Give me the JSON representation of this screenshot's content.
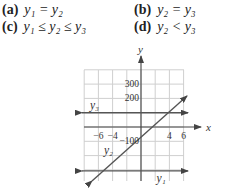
{
  "options": [
    {
      "label": "(a)",
      "expr": "y₁ = y₂"
    },
    {
      "label": "(b)",
      "expr": "y₂ = y₃"
    },
    {
      "label": "(c)",
      "expr": "y₁ ≤ y₂ ≤ y₃"
    },
    {
      "label": "(d)",
      "expr": "y₂ < y₃"
    }
  ],
  "chart_data": {
    "type": "line",
    "title": "",
    "xlabel": "x",
    "ylabel": "y",
    "xlim": [
      -7,
      7
    ],
    "ylim": [
      -400,
      400
    ],
    "grid": true,
    "x_tick_labels": [
      "-6",
      "-4",
      "4",
      "6"
    ],
    "x_ticks": [
      -6,
      -4,
      4,
      6
    ],
    "y_tick_labels": [
      "300",
      "200",
      "-100"
    ],
    "y_ticks": [
      300,
      200,
      -100
    ],
    "series": [
      {
        "name": "y3",
        "label": "y₃",
        "kind": "horizontal",
        "x": [
          -7,
          7
        ],
        "y": [
          100,
          100
        ]
      },
      {
        "name": "y2",
        "label": "y₂",
        "kind": "diagonal",
        "x": [
          -7,
          7
        ],
        "y": [
          -400,
          200
        ]
      },
      {
        "name": "y1",
        "label": "y₁",
        "kind": "horizontal",
        "x": [
          -7,
          7
        ],
        "y": [
          -300,
          -300
        ]
      }
    ],
    "colors": {
      "line": "#555555",
      "grid": "#cfcfcf",
      "axis": "#444444"
    }
  }
}
